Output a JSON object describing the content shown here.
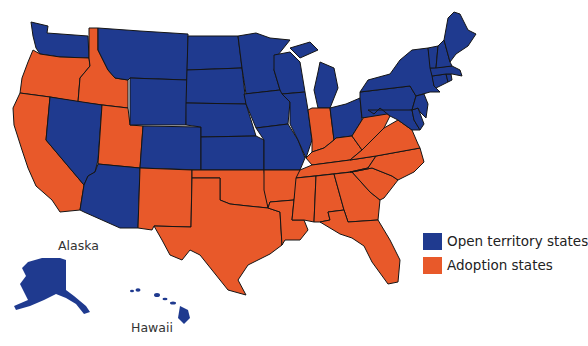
{
  "legend": {
    "items": [
      {
        "label": "Open territory states",
        "color": "#1f3a8f"
      },
      {
        "label": "Adoption states",
        "color": "#e8592a"
      }
    ]
  },
  "insets": {
    "alaska_label": "Alaska",
    "hawaii_label": "Hawaii"
  },
  "categories": {
    "open_territory": [
      "WA",
      "NV",
      "AZ",
      "MT",
      "WY",
      "CO",
      "ND",
      "SD",
      "NE",
      "KS",
      "MN",
      "IA",
      "MO",
      "WI",
      "IL",
      "MI",
      "OH",
      "PA",
      "NY",
      "VT",
      "NH",
      "ME",
      "MA",
      "RI",
      "CT",
      "NJ",
      "DE",
      "MD",
      "AK",
      "HI"
    ],
    "adoption": [
      "OR",
      "CA",
      "ID",
      "UT",
      "NM",
      "TX",
      "OK",
      "AR",
      "LA",
      "MS",
      "AL",
      "GA",
      "FL",
      "SC",
      "NC",
      "TN",
      "KY",
      "VA",
      "WV",
      "IN"
    ]
  },
  "colors": {
    "open_territory": "#1f3a8f",
    "adoption": "#e8592a",
    "border": "#151515",
    "background": "#ffffff"
  }
}
